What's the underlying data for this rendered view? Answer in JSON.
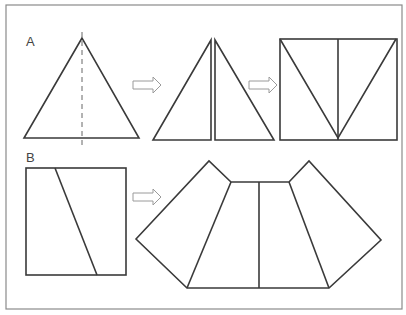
{
  "figure": {
    "panels": [
      {
        "label": "A",
        "description": "Equilateral triangle cut along altitude (dashed), halves rearranged into a rectangle"
      },
      {
        "label": "B",
        "description": "Square cut by slanted line, pieces rearranged into a fan-shaped polygon"
      }
    ],
    "colors": {
      "stroke": "#3a3a3a",
      "border": "#8a8a8a",
      "arrow": "#9a9a9a",
      "background": "#ffffff"
    }
  }
}
